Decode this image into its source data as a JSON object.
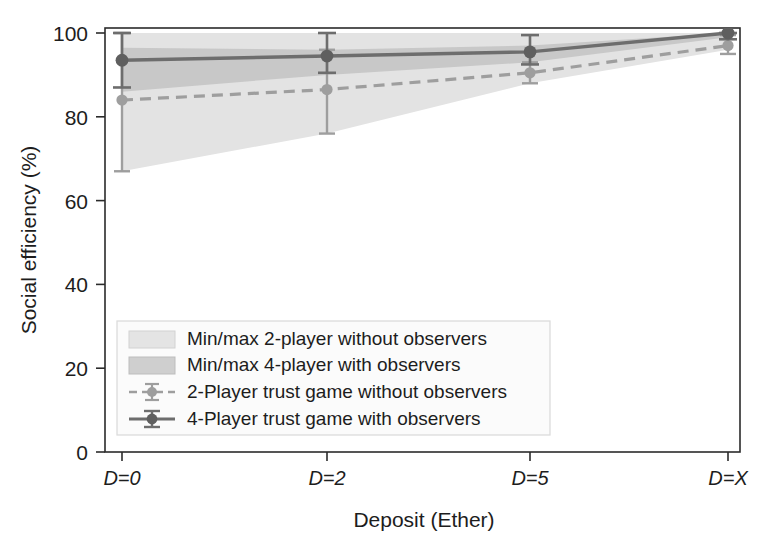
{
  "chart_data": {
    "type": "line",
    "title": "",
    "xlabel": "Deposit (Ether)",
    "ylabel": "Social efficiency (%)",
    "categories": [
      "D=0",
      "D=2",
      "D=5",
      "D=X"
    ],
    "xtick_labels": [
      "D=0",
      "D=2",
      "D=5",
      "D=X"
    ],
    "ytick_labels": [
      "0",
      "20",
      "40",
      "60",
      "80",
      "100"
    ],
    "ytick_values": [
      0,
      20,
      40,
      60,
      80,
      100
    ],
    "ylim": [
      0,
      100
    ],
    "xlim": [
      0,
      3
    ],
    "grid": false,
    "legend_position": "lower-left-inside",
    "series": [
      {
        "name": "2-Player trust game without observers",
        "style": "dashed-line-with-markers",
        "color": "#9b9b9b",
        "marker": "circle",
        "values": [
          84.0,
          86.5,
          90.5,
          97.0
        ],
        "err_low": [
          67.0,
          76.0,
          88.0,
          95.0
        ],
        "err_high": [
          100.0,
          96.0,
          93.0,
          99.5
        ]
      },
      {
        "name": "4-Player trust game with observers",
        "style": "solid-line-with-markers",
        "color": "#6a6a6a",
        "marker": "circle",
        "values": [
          93.5,
          94.5,
          95.5,
          100.0
        ],
        "err_low": [
          87.0,
          90.5,
          92.5,
          98.5
        ],
        "err_high": [
          100.0,
          100.0,
          99.5,
          100.0
        ]
      }
    ],
    "bands": [
      {
        "name": "Min/max 2-player without observers",
        "color": "#e3e3e3",
        "lower": [
          67.0,
          76.0,
          88.0,
          96.0
        ],
        "upper": [
          100.0,
          100.0,
          100.0,
          100.0
        ]
      },
      {
        "name": "Min/max 4-player with observers",
        "color": "#c8c8c8",
        "lower": [
          86.0,
          90.0,
          93.0,
          99.0
        ],
        "upper": [
          96.5,
          96.0,
          97.0,
          100.0
        ]
      }
    ],
    "legend_entries": [
      {
        "label": "Min/max 2-player without observers",
        "swatch": "band",
        "color": "#e3e3e3"
      },
      {
        "label": "Min/max 4-player with observers",
        "swatch": "band",
        "color": "#c8c8c8"
      },
      {
        "label": "2-Player trust game without observers",
        "swatch": "dashed-marker",
        "color": "#9b9b9b"
      },
      {
        "label": "4-Player trust game with observers",
        "swatch": "solid-marker",
        "color": "#6a6a6a"
      }
    ]
  },
  "axes": {
    "y_title": "Social efficiency (%)",
    "x_title": "Deposit (Ether)",
    "y_ticks": [
      "100",
      "80",
      "60",
      "40",
      "20",
      "0"
    ],
    "x_ticks": [
      "D=0",
      "D=2",
      "D=5",
      "D=X"
    ]
  },
  "legend": {
    "item1": "Min/max 2-player without observers",
    "item2": "Min/max 4-player with observers",
    "item3": "2-Player trust game without observers",
    "item4": "4-Player trust game with observers"
  },
  "colors": {
    "band_light": "#e3e3e3",
    "band_dark": "#c8c8c8",
    "series_light": "#9b9b9b",
    "series_dark": "#6a6a6a",
    "axis": "#2b2b2b",
    "background": "#ffffff"
  }
}
